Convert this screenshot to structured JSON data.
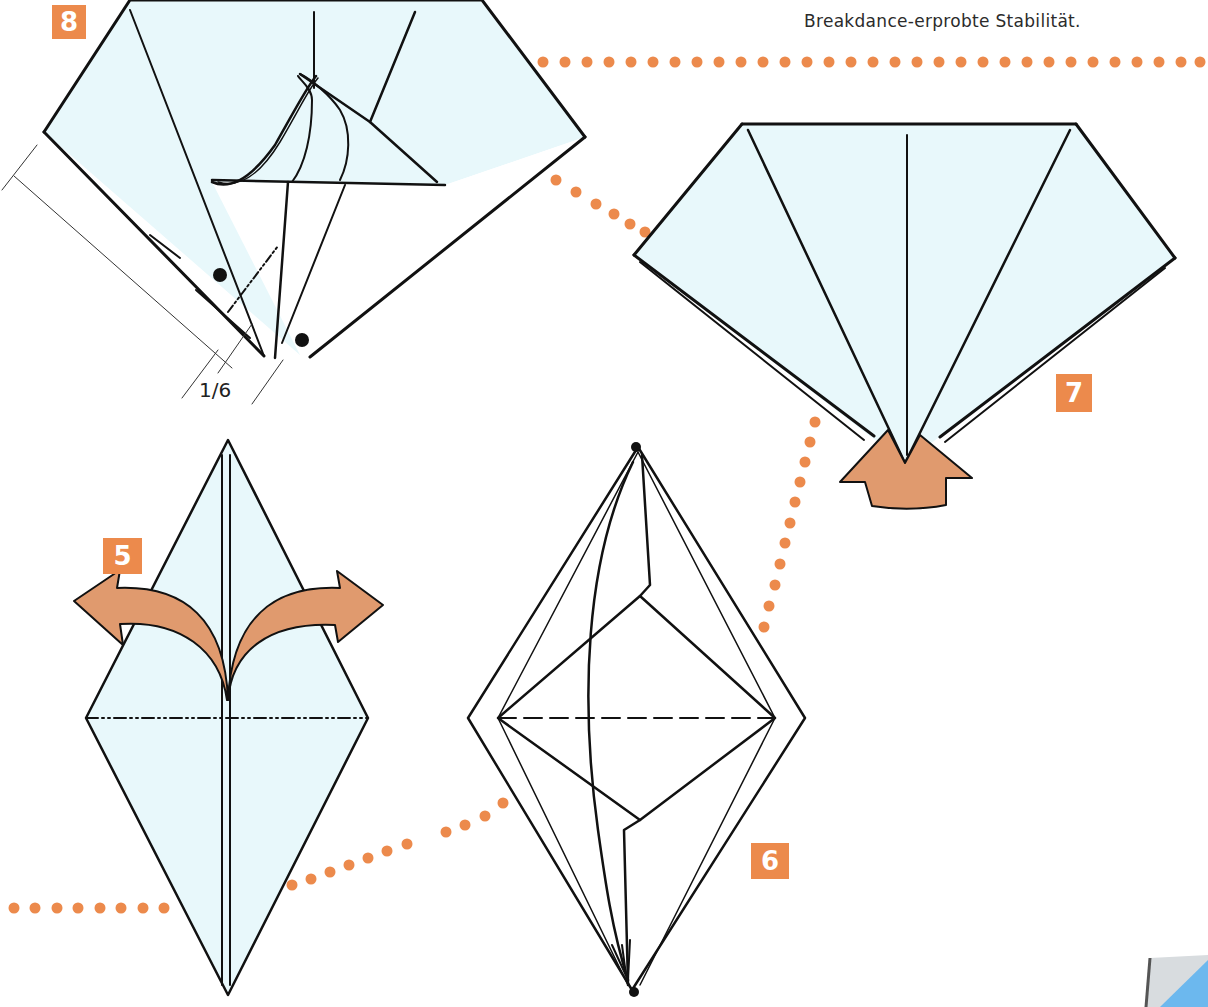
{
  "page": {
    "caption_line_visible": "Breakdance-erprobte Stabilität.",
    "colors": {
      "paper_fill": "#e8f8fb",
      "line": "#111111",
      "accent_orange": "#ec8a4c",
      "arrow_fill": "#e09a6e",
      "corner_blue": "#6cb8ee",
      "corner_gray": "#d8dcdf"
    }
  },
  "steps": [
    {
      "number": "8",
      "badge_label": "8",
      "dimension_label": "1/6"
    },
    {
      "number": "7",
      "badge_label": "7"
    },
    {
      "number": "5",
      "badge_label": "5"
    },
    {
      "number": "6",
      "badge_label": "6"
    }
  ],
  "icons": {
    "step7_arrow": "push-up-arrow-icon",
    "step5_arrows": "unfold-arrows-icon",
    "step6_arrow": "fold-down-arrow-icon",
    "page_corner": "page-curl-icon"
  }
}
